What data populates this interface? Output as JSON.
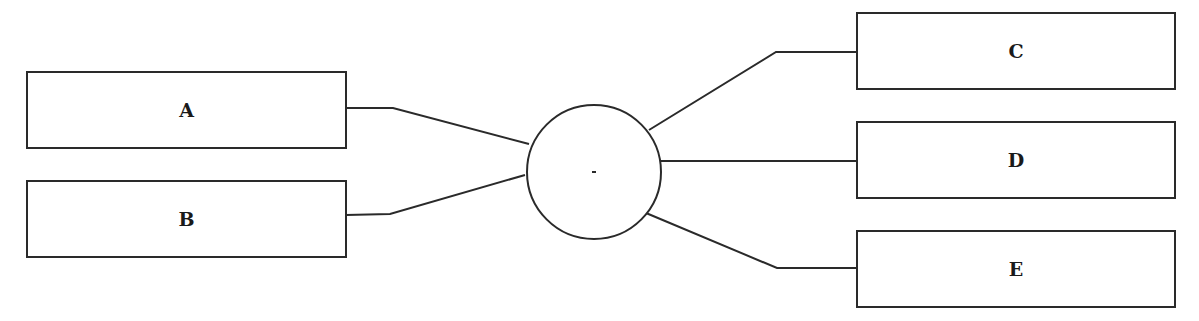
{
  "diagram": {
    "type": "hub-and-spoke",
    "hub": {
      "label": "",
      "shape": "circle"
    },
    "nodes": [
      {
        "id": "A",
        "label": "A",
        "side": "left"
      },
      {
        "id": "B",
        "label": "B",
        "side": "left"
      },
      {
        "id": "C",
        "label": "C",
        "side": "right"
      },
      {
        "id": "D",
        "label": "D",
        "side": "right"
      },
      {
        "id": "E",
        "label": "E",
        "side": "right"
      }
    ],
    "edges": [
      {
        "from": "A",
        "to": "hub"
      },
      {
        "from": "B",
        "to": "hub"
      },
      {
        "from": "hub",
        "to": "C"
      },
      {
        "from": "hub",
        "to": "D"
      },
      {
        "from": "hub",
        "to": "E"
      }
    ],
    "colors": {
      "stroke": "#2a2a2a",
      "background": "#ffffff",
      "text": "#1a1a1a"
    }
  }
}
